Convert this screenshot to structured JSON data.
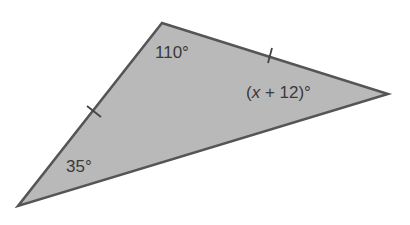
{
  "diagram": {
    "type": "triangle",
    "fill_color": "#b9b9b9",
    "stroke_color": "#555555",
    "vertices": {
      "top": [
        162,
        23
      ],
      "right": [
        388,
        94
      ],
      "bottom_left": [
        18,
        206
      ]
    },
    "congruent_sides": [
      "top-to-right",
      "top-to-bottom_left"
    ],
    "angles": {
      "top": "110°",
      "right_prefix": "(",
      "right_var": "x",
      "right_suffix": " + 12)°",
      "bottom_left": "35°"
    }
  }
}
